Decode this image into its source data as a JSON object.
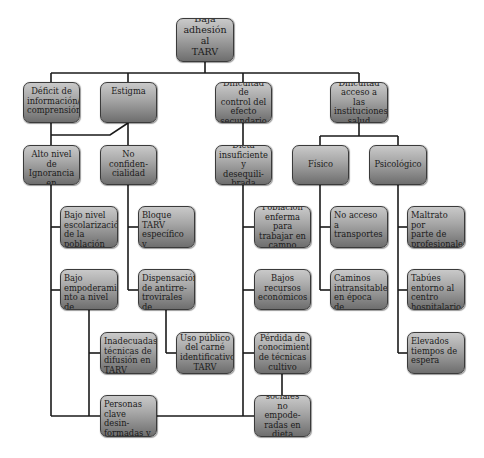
{
  "root": {
    "label": "Baja\nadhesión al\nTARV para"
  },
  "level1": [
    {
      "id": "deficit",
      "label": "Déficit de\ninformación/\ncomprensión"
    },
    {
      "id": "estigma",
      "label": "Estigma"
    },
    {
      "id": "dificultad-control",
      "label": "Dificultad de\ncontrol del\nefecto\nsecundario"
    },
    {
      "id": "dificultad-acceso",
      "label": "Dificultad\nacceso a las\ninstituciones\nsalud"
    }
  ],
  "level2": [
    {
      "id": "alto-nivel",
      "label": "Alto nivel de\nIgnorancia en\nmateria TARV"
    },
    {
      "id": "no-confidencialidad",
      "label": "No confiden-\ncialidad"
    },
    {
      "id": "dieta",
      "label": "Dieta\ninsuficiente y\ndesequili-\nbrada"
    },
    {
      "id": "fisico",
      "label": "Físico"
    },
    {
      "id": "psicologico",
      "label": "Psicológico"
    }
  ],
  "level3": {
    "ignorancia_children": [
      {
        "id": "bajo-nivel",
        "label": "Bajo nivel\nescolarización\nde la\npoblación"
      },
      {
        "id": "bajo-empoderamiento",
        "label": "Bajo\nempoderamie\nnto a nivel de\ncomunidad"
      },
      {
        "id": "inadecuadas",
        "label": "Inadecuadas\ntécnicas de\ndifusión en\nTARV"
      },
      {
        "id": "personas-clave",
        "label": "Personas\nclave desin-\nformadas y\ndesvinculadas"
      }
    ],
    "confidencialidad_children": [
      {
        "id": "bloque-tarv",
        "label": "Bloque TARV\nespecífico y\ndiferenciado"
      },
      {
        "id": "dispensacion",
        "label": "Dispensación\nde antirre-\ntrovirales de\nforma pública"
      },
      {
        "id": "uso-publico",
        "label": "Uso público\ndel carné\nidentificativo\nTARV"
      }
    ],
    "dieta_children": [
      {
        "id": "poblacion-enferma",
        "label": "Población\nenferma para\ntrabajar en\ncampo"
      },
      {
        "id": "bajos-recursos",
        "label": "Bajos\nrecursos\neconómicos"
      },
      {
        "id": "perdida",
        "label": "Pérdida de\nconocimiento\nde técnicas\ncultivo"
      },
      {
        "id": "redes-sociales",
        "label": "Redes sociales\nno empode-\nradas en dieta\nsaludable"
      }
    ],
    "fisico_children": [
      {
        "id": "no-acceso",
        "label": "No  acceso a\ntransportes"
      },
      {
        "id": "caminos",
        "label": "Caminos\nintransitables\nen época de\nlluvias"
      }
    ],
    "psicologico_children": [
      {
        "id": "maltrato",
        "label": "Maltrato por\nparte de\nprofesionales\nsanitarios"
      },
      {
        "id": "tabues",
        "label": "Tabúes\nentorno al\ncentro\nhospitalario"
      },
      {
        "id": "elevados",
        "label": "Elevados\ntiempos de\nespera"
      }
    ]
  },
  "colors": {
    "box_top": "#c9c9c9",
    "box_bottom": "#6e6e6e",
    "line": "#1a1a1a",
    "border": "#3a3a3a"
  }
}
